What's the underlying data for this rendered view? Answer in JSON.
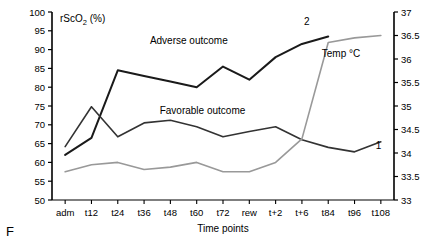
{
  "figure": {
    "panel_letter": "F"
  },
  "chart_data": {
    "type": "line",
    "title": "",
    "xlabel": "Time points",
    "ylabel": "rScO2 (%)",
    "ylabel_main": "rScO",
    "ylabel_sub": "2",
    "ylabel_unit": " (%)",
    "y2label": "Temp °C",
    "grid": false,
    "legend": "inline-annotations",
    "categories": [
      "adm",
      "t12",
      "t24",
      "t36",
      "t48",
      "t60",
      "t72",
      "rew",
      "t+2",
      "t+6",
      "t84",
      "t96",
      "t108"
    ],
    "ylim": [
      50,
      100
    ],
    "yticks": [
      50,
      55,
      60,
      65,
      70,
      75,
      80,
      85,
      90,
      95,
      100
    ],
    "y2lim": [
      33,
      37
    ],
    "y2ticks": [
      33,
      33.5,
      34,
      34.5,
      35,
      35.5,
      36,
      36.5,
      37
    ],
    "series": [
      {
        "name": "Adverse outcome",
        "number": "2",
        "axis": "left",
        "color": "#1a1a1a",
        "width": 2.0,
        "values": [
          62.0,
          66.5,
          84.5,
          83.0,
          81.5,
          80.0,
          85.5,
          82.0,
          88.0,
          91.5,
          93.5,
          null,
          null
        ]
      },
      {
        "name": "Favorable outcome",
        "number": "1",
        "axis": "left",
        "color": "#333333",
        "width": 1.6,
        "values": [
          64.2,
          74.8,
          66.8,
          70.5,
          71.2,
          69.5,
          66.8,
          68.2,
          69.5,
          66.0,
          64.0,
          62.8,
          65.5
        ]
      },
      {
        "name": "Temp °C",
        "number": "",
        "axis": "right",
        "color": "#999999",
        "width": 1.6,
        "values": [
          33.6,
          33.75,
          33.8,
          33.65,
          33.7,
          33.8,
          33.6,
          33.6,
          33.8,
          34.3,
          36.35,
          36.45,
          36.5
        ]
      }
    ],
    "annotations": [
      {
        "text": "Adverse outcome",
        "x_frac": 0.4,
        "y_value": 91.5
      },
      {
        "text": "Favorable outcome",
        "x_frac": 0.44,
        "y_value": 73.0
      },
      {
        "text": "Temp °C",
        "x_frac": 0.845,
        "y_value": 88.0
      },
      {
        "text": "2",
        "x_frac": 0.745,
        "y_value": 96.5
      },
      {
        "text": "1",
        "x_frac": 0.955,
        "y_value": 63.5
      }
    ]
  }
}
